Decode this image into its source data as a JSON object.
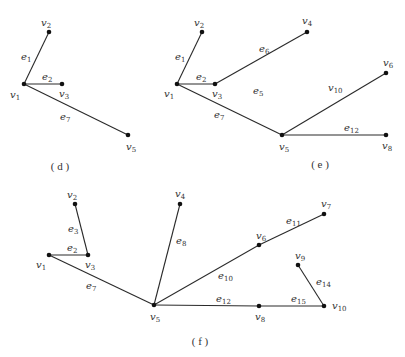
{
  "panels": [
    {
      "id": "d",
      "caption": "( d )",
      "caption_pos": [
        60,
        170
      ],
      "vertices": [
        {
          "name": "v",
          "sub": "1",
          "x": 24,
          "y": 84,
          "lx": 10,
          "ly": 98
        },
        {
          "name": "v",
          "sub": "2",
          "x": 49,
          "y": 32,
          "lx": 41,
          "ly": 26
        },
        {
          "name": "v",
          "sub": "3",
          "x": 62,
          "y": 84,
          "lx": 59,
          "ly": 97
        },
        {
          "name": "v",
          "sub": "5",
          "x": 128,
          "y": 135,
          "lx": 126,
          "ly": 150
        }
      ],
      "edges": [
        {
          "from": 0,
          "to": 1,
          "name": "e",
          "sub": "1",
          "lx": 21,
          "ly": 60
        },
        {
          "from": 0,
          "to": 2,
          "name": "e",
          "sub": "2",
          "lx": 42,
          "ly": 80
        },
        {
          "from": 0,
          "to": 3,
          "name": "e",
          "sub": "7",
          "lx": 60,
          "ly": 120
        }
      ]
    },
    {
      "id": "e",
      "caption": "( e )",
      "caption_pos": [
        320,
        168
      ],
      "vertices": [
        {
          "name": "v",
          "sub": "1",
          "x": 177,
          "y": 84,
          "lx": 164,
          "ly": 97
        },
        {
          "name": "v",
          "sub": "2",
          "x": 202,
          "y": 32,
          "lx": 194,
          "ly": 26
        },
        {
          "name": "v",
          "sub": "3",
          "x": 215,
          "y": 84,
          "lx": 212,
          "ly": 97
        },
        {
          "name": "v",
          "sub": "4",
          "x": 307,
          "y": 32,
          "lx": 302,
          "ly": 24
        },
        {
          "name": "v",
          "sub": "5",
          "x": 282,
          "y": 135,
          "lx": 279,
          "ly": 150
        },
        {
          "name": "v",
          "sub": "6",
          "x": 386,
          "y": 73,
          "lx": 383,
          "ly": 66
        },
        {
          "name": "v",
          "sub": "8",
          "x": 386,
          "y": 135,
          "lx": 382,
          "ly": 149
        }
      ],
      "edges": [
        {
          "from": 0,
          "to": 1,
          "name": "e",
          "sub": "1",
          "lx": 175,
          "ly": 60
        },
        {
          "from": 0,
          "to": 2,
          "name": "e",
          "sub": "2",
          "lx": 196,
          "ly": 80
        },
        {
          "from": 2,
          "to": 3,
          "name": "e",
          "sub": "6",
          "lx": 259,
          "ly": 52
        },
        {
          "from": 0,
          "to": 4,
          "name": "e",
          "sub": "7",
          "lx": 214,
          "ly": 118
        },
        {
          "from": 4,
          "to": 5,
          "name": "v",
          "sub": "10",
          "lx": 328,
          "ly": 91
        },
        {
          "from": 4,
          "to": 6,
          "name": "e",
          "sub": "12",
          "lx": 344,
          "ly": 131
        }
      ],
      "floating_labels": [
        {
          "name": "e",
          "sub": "5",
          "lx": 253,
          "ly": 94
        }
      ]
    },
    {
      "id": "f",
      "caption": "( f )",
      "caption_pos": [
        200,
        345
      ],
      "vertices": [
        {
          "name": "v",
          "sub": "1",
          "x": 49,
          "y": 255,
          "lx": 36,
          "ly": 268
        },
        {
          "name": "v",
          "sub": "2",
          "x": 75,
          "y": 204,
          "lx": 67,
          "ly": 198
        },
        {
          "name": "v",
          "sub": "3",
          "x": 88,
          "y": 255,
          "lx": 85,
          "ly": 268
        },
        {
          "name": "v",
          "sub": "4",
          "x": 180,
          "y": 204,
          "lx": 175,
          "ly": 197
        },
        {
          "name": "v",
          "sub": "5",
          "x": 154,
          "y": 305,
          "lx": 150,
          "ly": 320
        },
        {
          "name": "v",
          "sub": "6",
          "x": 259,
          "y": 245,
          "lx": 256,
          "ly": 239
        },
        {
          "name": "v",
          "sub": "7",
          "x": 324,
          "y": 214,
          "lx": 321,
          "ly": 207
        },
        {
          "name": "v",
          "sub": "8",
          "x": 259,
          "y": 306,
          "lx": 255,
          "ly": 320
        },
        {
          "name": "v",
          "sub": "9",
          "x": 298,
          "y": 265,
          "lx": 295,
          "ly": 259
        },
        {
          "name": "v",
          "sub": "10",
          "x": 324,
          "y": 306,
          "lx": 332,
          "ly": 309
        }
      ],
      "edges": [
        {
          "from": 1,
          "to": 2,
          "name": "e",
          "sub": "3",
          "lx": 68,
          "ly": 232
        },
        {
          "from": 0,
          "to": 2,
          "name": "e",
          "sub": "2",
          "lx": 67,
          "ly": 251
        },
        {
          "from": 0,
          "to": 4,
          "name": "e",
          "sub": "7",
          "lx": 86,
          "ly": 289
        },
        {
          "from": 3,
          "to": 4,
          "name": "e",
          "sub": "8",
          "lx": 176,
          "ly": 244
        },
        {
          "from": 4,
          "to": 5,
          "name": "e",
          "sub": "10",
          "lx": 218,
          "ly": 279
        },
        {
          "from": 5,
          "to": 6,
          "name": "e",
          "sub": "11",
          "lx": 286,
          "ly": 224
        },
        {
          "from": 4,
          "to": 7,
          "name": "e",
          "sub": "12",
          "lx": 216,
          "ly": 302
        },
        {
          "from": 7,
          "to": 9,
          "name": "e",
          "sub": "15",
          "lx": 291,
          "ly": 302
        },
        {
          "from": 8,
          "to": 9,
          "name": "e",
          "sub": "14",
          "lx": 316,
          "ly": 285
        }
      ]
    }
  ]
}
